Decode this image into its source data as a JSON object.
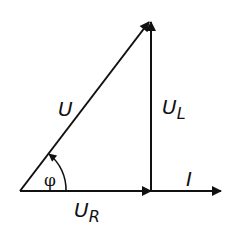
{
  "diagram": {
    "labels": {
      "voltage_total": "U",
      "voltage_inductive": "U",
      "voltage_inductive_sub": "L",
      "voltage_resistive": "U",
      "voltage_resistive_sub": "R",
      "current": "I",
      "phase_angle": "φ"
    },
    "colors": {
      "stroke": "#111111",
      "background": "#ffffff"
    }
  }
}
